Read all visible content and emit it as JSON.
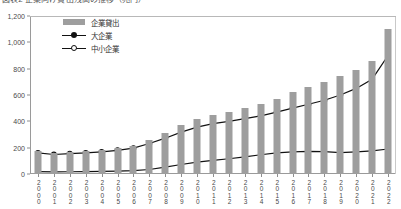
{
  "title": "図表2 企業向け貸出残高の推移（兆円）",
  "chart_data": {
    "type": "bar",
    "title": "図表2 企業向け貸出残高の推移（兆円）",
    "xlabel": "",
    "ylabel": "",
    "ylim": [
      0,
      1200
    ],
    "yticks": [
      0,
      200,
      400,
      600,
      800,
      1000,
      1200
    ],
    "ytick_labels": [
      "0",
      "200",
      "400",
      "600",
      "800",
      "1,000",
      "1,200"
    ],
    "grid": false,
    "legend_position": "upper-left",
    "categories": [
      "2000",
      "2001",
      "2002",
      "2003",
      "2004",
      "2005",
      "2006",
      "2007",
      "2008",
      "2009",
      "2010",
      "2011",
      "2012",
      "2013",
      "2014",
      "2015",
      "2016",
      "2017",
      "2018",
      "2019",
      "2020",
      "2021",
      "2022"
    ],
    "series": [
      {
        "name": "企業貸出",
        "type": "bar",
        "color": "#9e9e9e",
        "values": [
          178,
          160,
          168,
          172,
          182,
          196,
          215,
          258,
          310,
          372,
          420,
          448,
          470,
          498,
          530,
          572,
          620,
          660,
          700,
          742,
          790,
          860,
          1105
        ]
      },
      {
        "name": "大企業",
        "type": "line",
        "marker": "filled-circle",
        "color": "#111111",
        "values": [
          18,
          16,
          17,
          18,
          20,
          22,
          26,
          34,
          52,
          72,
          90,
          104,
          116,
          130,
          146,
          160,
          168,
          172,
          170,
          162,
          168,
          176,
          190
        ]
      },
      {
        "name": "中小企業",
        "type": "line",
        "marker": "open-circle",
        "color": "#111111",
        "values": [
          160,
          148,
          155,
          160,
          168,
          180,
          196,
          232,
          272,
          318,
          356,
          382,
          400,
          420,
          442,
          470,
          500,
          530,
          560,
          600,
          650,
          720,
          900
        ]
      }
    ]
  },
  "legend": [
    {
      "label": "企業貸出",
      "key": "bar-swatch"
    },
    {
      "label": "大企業",
      "key": "line-filled-marker"
    },
    {
      "label": "中小企業",
      "key": "line-open-marker"
    }
  ]
}
